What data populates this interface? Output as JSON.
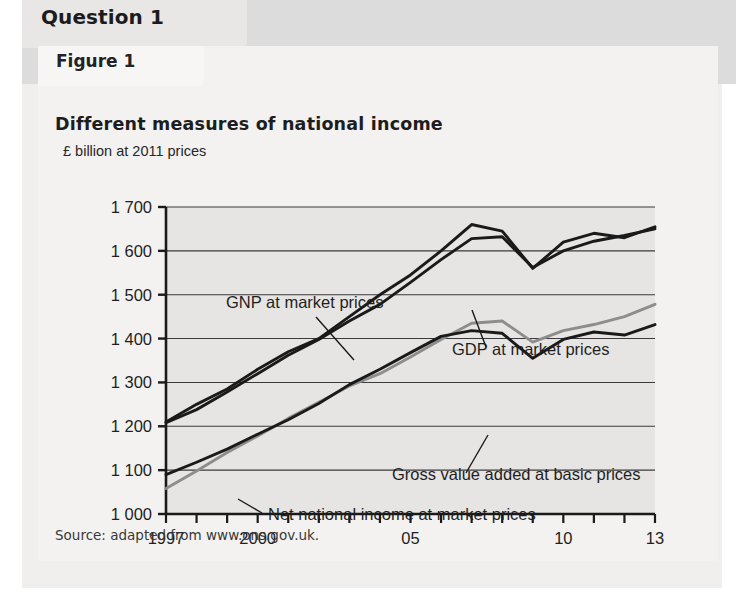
{
  "question": {
    "tab_label": "Question 1"
  },
  "figure": {
    "tab_label": "Figure 1",
    "title": "Different measures of national income",
    "subtitle": "£ billion at 2011 prices",
    "source": "Source: adapted from www.ons.gov.uk."
  },
  "chart_data": {
    "type": "line",
    "title": "Different measures of national income",
    "subtitle": "£ billion at 2011 prices",
    "xlabel": "",
    "ylabel": "£ billion at 2011 prices",
    "ylim": [
      1000,
      1700
    ],
    "ytick_values": [
      1000,
      1100,
      1200,
      1300,
      1400,
      1500,
      1600,
      1700
    ],
    "ytick_labels": [
      "1 000",
      "1 100",
      "1 200",
      "1 300",
      "1 400",
      "1 500",
      "1 600",
      "1 700"
    ],
    "xlim": [
      1997,
      2013
    ],
    "x": [
      1997,
      1998,
      1999,
      2000,
      2001,
      2002,
      2003,
      2004,
      2005,
      2006,
      2007,
      2008,
      2009,
      2010,
      2011,
      2012,
      2013
    ],
    "xtick_values": [
      1997,
      1998,
      1999,
      2000,
      2001,
      2002,
      2003,
      2004,
      2005,
      2006,
      2007,
      2008,
      2009,
      2010,
      2011,
      2012,
      2013
    ],
    "xtick_labels": [
      "1997",
      "",
      "",
      "2000",
      "",
      "",
      "",
      "",
      "05",
      "",
      "",
      "",
      "",
      "10",
      "",
      "",
      "13"
    ],
    "grid": true,
    "grid_axis": "y",
    "legend_position": "inline-annotations",
    "series": [
      {
        "name": "GNP at market prices",
        "color": "#1a1a1a",
        "values": [
          1210,
          1250,
          1285,
          1330,
          1370,
          1400,
          1450,
          1500,
          1545,
          1600,
          1660,
          1645,
          1560,
          1620,
          1640,
          1630,
          1655
        ]
      },
      {
        "name": "GDP at market prices",
        "color": "#1a1a1a",
        "values": [
          1208,
          1238,
          1278,
          1320,
          1362,
          1398,
          1440,
          1478,
          1528,
          1580,
          1628,
          1632,
          1562,
          1600,
          1622,
          1635,
          1650
        ]
      },
      {
        "name": "Gross value added at basic prices",
        "color": "#8d8d8d",
        "values": [
          1058,
          1098,
          1140,
          1178,
          1218,
          1255,
          1292,
          1320,
          1358,
          1398,
          1435,
          1440,
          1392,
          1418,
          1432,
          1450,
          1478
        ]
      },
      {
        "name": "Net national income at market prices",
        "color": "#1a1a1a",
        "values": [
          1090,
          1118,
          1148,
          1182,
          1215,
          1252,
          1295,
          1330,
          1368,
          1405,
          1418,
          1412,
          1355,
          1398,
          1415,
          1408,
          1432
        ]
      }
    ],
    "annotations": [
      {
        "text": "GNP at market prices",
        "target_year": 2001,
        "target_value": 1382
      },
      {
        "text": "GDP at market prices",
        "target_year": 2006,
        "target_value": 1582
      },
      {
        "text": "Gross value added at basic prices",
        "target_year": 2004,
        "target_value": 1322
      },
      {
        "text": "Net national income at market prices",
        "target_year": 2000,
        "target_value": 1185
      }
    ]
  }
}
